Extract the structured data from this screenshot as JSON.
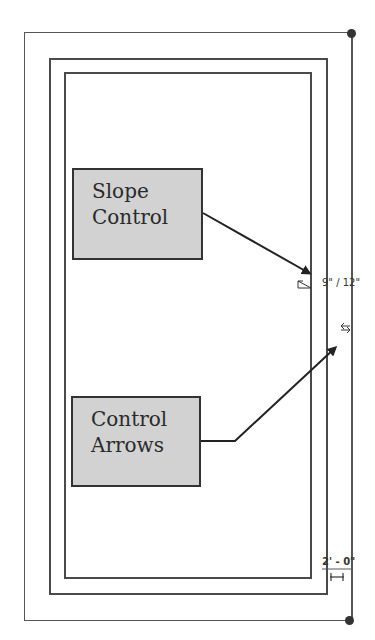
{
  "diagram": {
    "callouts": [
      {
        "id": "slope-control",
        "lines": [
          "Slope",
          "Control"
        ]
      },
      {
        "id": "control-arrows",
        "lines": [
          "Control",
          "Arrows"
        ]
      }
    ],
    "annotations": {
      "slope_value": "9\" / 12\"",
      "dimension_value": "2' - 0\""
    },
    "icons": {
      "slope": "slope-triangle-icon",
      "flip": "flip-arrows-icon",
      "dimension": "dimension-bar-icon"
    },
    "colors": {
      "line": "#4a4a4a",
      "callout_fill": "#d2d2d2",
      "callout_border": "#333333",
      "arrow": "#222222"
    }
  }
}
